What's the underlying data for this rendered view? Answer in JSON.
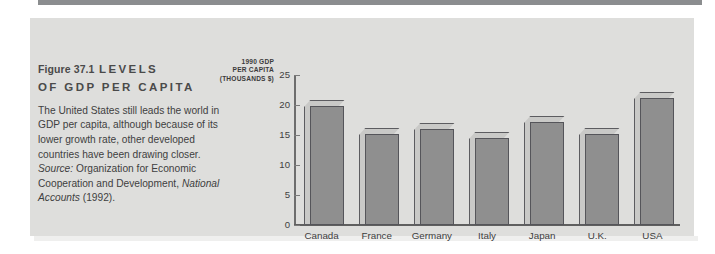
{
  "figure": {
    "number": "Figure 37.1",
    "heading": "LEVELS",
    "heading_line2": "OF GDP PER CAPITA",
    "caption": "The United States still leads the world in GDP per capita, although because of its lower growth rate, other developed countries have been drawing closer.",
    "source_lead": "Source:",
    "source_text": "Organization for Economic Cooperation and Development,",
    "source_title": "National Accounts",
    "source_year": "(1992)."
  },
  "chart_data": {
    "type": "bar",
    "title": "",
    "axis_title_lines": [
      "1990 GDP",
      "PER CAPITA",
      "(THOUSANDS $)"
    ],
    "ylabel": "1990 GDP PER CAPITA (THOUSANDS $)",
    "xlabel": "",
    "categories": [
      "Canada",
      "France",
      "Germany",
      "Italy",
      "Japan",
      "U.K.",
      "USA"
    ],
    "values": [
      19.8,
      15.2,
      16.0,
      14.5,
      17.2,
      15.1,
      21.2
    ],
    "ylim": [
      0,
      25
    ],
    "yticks": [
      25,
      20,
      15,
      10,
      5,
      0
    ],
    "grid": false,
    "legend": "none",
    "colors": {
      "bar_face": "#8f8f8f",
      "bar_top": "#c9c9c7",
      "bar_outline": "#55555a",
      "panel_bg": "#dededc",
      "axis": "#6d6d6d",
      "text": "#3f3f3f"
    }
  }
}
